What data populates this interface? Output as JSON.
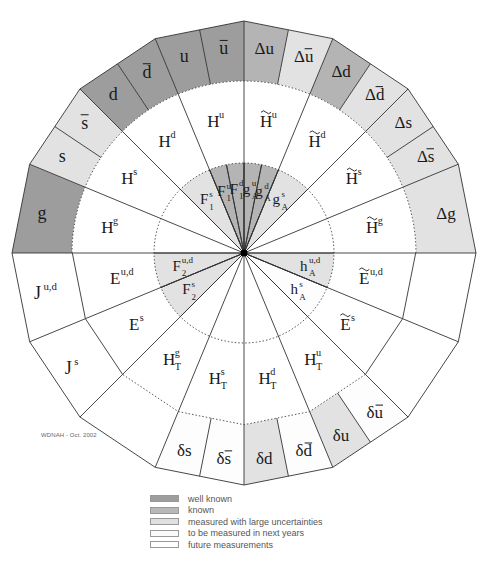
{
  "credit": "WDNAH - Oct. 2002",
  "colors": {
    "well_known": "#9d9d9d",
    "known": "#b8b8b8",
    "large_uncertainties": "#e0e0e0",
    "next_years": "#ffffff",
    "future": "#ffffff",
    "line": "#333333"
  },
  "legend": [
    {
      "label": "well known",
      "color": "#9d9d9d"
    },
    {
      "label": "known",
      "color": "#b8b8b8"
    },
    {
      "label": "measured with large uncertainties",
      "color": "#e0e0e0"
    },
    {
      "label": "to be measured in next years",
      "color": "#fafafa"
    },
    {
      "label": "future measurements",
      "color": "#ffffff"
    }
  ],
  "outer_ring": [
    {
      "id": "g",
      "main": "g",
      "sup": "",
      "sub": "",
      "bar": false,
      "tilde": false,
      "from": -90,
      "to": -67.5,
      "status": "well_known"
    },
    {
      "id": "s",
      "main": "s",
      "sup": "",
      "sub": "",
      "bar": false,
      "tilde": false,
      "from": -67.5,
      "to": -56.25,
      "status": "large_uncertainties"
    },
    {
      "id": "sbar",
      "main": "s",
      "sup": "",
      "sub": "",
      "bar": true,
      "tilde": false,
      "from": -56.25,
      "to": -45,
      "status": "large_uncertainties"
    },
    {
      "id": "d",
      "main": "d",
      "sup": "",
      "sub": "",
      "bar": false,
      "tilde": false,
      "from": -45,
      "to": -33.75,
      "status": "well_known"
    },
    {
      "id": "dbar",
      "main": "d",
      "sup": "",
      "sub": "",
      "bar": true,
      "tilde": false,
      "from": -33.75,
      "to": -22.5,
      "status": "well_known"
    },
    {
      "id": "u",
      "main": "u",
      "sup": "",
      "sub": "",
      "bar": false,
      "tilde": false,
      "from": -22.5,
      "to": -11.25,
      "status": "well_known"
    },
    {
      "id": "ubar",
      "main": "u",
      "sup": "",
      "sub": "",
      "bar": true,
      "tilde": false,
      "from": -11.25,
      "to": 0,
      "status": "well_known"
    },
    {
      "id": "Du",
      "main": "Δu",
      "sup": "",
      "sub": "",
      "bar": false,
      "tilde": false,
      "from": 0,
      "to": 11.25,
      "status": "known"
    },
    {
      "id": "Dubar",
      "main": "Δu",
      "sup": "",
      "sub": "",
      "bar": true,
      "tilde": false,
      "from": 11.25,
      "to": 22.5,
      "status": "large_uncertainties"
    },
    {
      "id": "Dd",
      "main": "Δd",
      "sup": "",
      "sub": "",
      "bar": false,
      "tilde": false,
      "from": 22.5,
      "to": 33.75,
      "status": "known"
    },
    {
      "id": "Ddbar",
      "main": "Δd",
      "sup": "",
      "sub": "",
      "bar": true,
      "tilde": false,
      "from": 33.75,
      "to": 45,
      "status": "large_uncertainties"
    },
    {
      "id": "Ds",
      "main": "Δs",
      "sup": "",
      "sub": "",
      "bar": false,
      "tilde": false,
      "from": 45,
      "to": 56.25,
      "status": "large_uncertainties"
    },
    {
      "id": "Dsbar",
      "main": "Δs",
      "sup": "",
      "sub": "",
      "bar": true,
      "tilde": false,
      "from": 56.25,
      "to": 67.5,
      "status": "large_uncertainties"
    },
    {
      "id": "Dg",
      "main": "Δg",
      "sup": "",
      "sub": "",
      "bar": false,
      "tilde": false,
      "from": 67.5,
      "to": 90,
      "status": "large_uncertainties"
    },
    {
      "id": "blank-r1",
      "main": "",
      "sup": "",
      "sub": "",
      "bar": false,
      "tilde": false,
      "from": 90,
      "to": 112.5,
      "status": "future"
    },
    {
      "id": "blank-r2",
      "main": "",
      "sup": "",
      "sub": "",
      "bar": false,
      "tilde": false,
      "from": 112.5,
      "to": 135,
      "status": "future"
    },
    {
      "id": "dubar",
      "main": "δu",
      "sup": "",
      "sub": "",
      "bar": true,
      "tilde": false,
      "from": 135,
      "to": 146.25,
      "status": "next_years"
    },
    {
      "id": "du",
      "main": "δu",
      "sup": "",
      "sub": "",
      "bar": false,
      "tilde": false,
      "from": 146.25,
      "to": 157.5,
      "status": "large_uncertainties"
    },
    {
      "id": "ddbar",
      "main": "δd",
      "sup": "",
      "sub": "",
      "bar": true,
      "tilde": false,
      "from": 157.5,
      "to": 168.75,
      "status": "next_years"
    },
    {
      "id": "dd",
      "main": "δd",
      "sup": "",
      "sub": "",
      "bar": false,
      "tilde": false,
      "from": 168.75,
      "to": 180,
      "status": "large_uncertainties"
    },
    {
      "id": "dsbar",
      "main": "δs",
      "sup": "",
      "sub": "",
      "bar": true,
      "tilde": false,
      "from": 180,
      "to": 191.25,
      "status": "next_years"
    },
    {
      "id": "ds",
      "main": "δs",
      "sup": "",
      "sub": "",
      "bar": false,
      "tilde": false,
      "from": 191.25,
      "to": 202.5,
      "status": "next_years"
    },
    {
      "id": "blank-l2",
      "main": "",
      "sup": "",
      "sub": "",
      "bar": false,
      "tilde": false,
      "from": 202.5,
      "to": 225,
      "status": "future"
    },
    {
      "id": "Js",
      "main": "J",
      "sup": "s",
      "sub": "",
      "bar": false,
      "tilde": false,
      "from": 225,
      "to": 247.5,
      "status": "future"
    },
    {
      "id": "Jud",
      "main": "J",
      "sup": "u,d",
      "sub": "",
      "bar": false,
      "tilde": false,
      "from": 247.5,
      "to": 270,
      "status": "future"
    }
  ],
  "middle_ring": [
    {
      "id": "Hg",
      "main": "H",
      "sup": "g",
      "sub": "",
      "tilde": false,
      "from": -90,
      "to": -67.5
    },
    {
      "id": "Hs",
      "main": "H",
      "sup": "s",
      "sub": "",
      "tilde": false,
      "from": -67.5,
      "to": -45
    },
    {
      "id": "Hd",
      "main": "H",
      "sup": "d",
      "sub": "",
      "tilde": false,
      "from": -45,
      "to": -22.5
    },
    {
      "id": "Hu",
      "main": "H",
      "sup": "u",
      "sub": "",
      "tilde": false,
      "from": -22.5,
      "to": 0
    },
    {
      "id": "tHu",
      "main": "H",
      "sup": "u",
      "sub": "",
      "tilde": true,
      "from": 0,
      "to": 22.5
    },
    {
      "id": "tHd",
      "main": "H",
      "sup": "d",
      "sub": "",
      "tilde": true,
      "from": 22.5,
      "to": 45
    },
    {
      "id": "tHs",
      "main": "H",
      "sup": "s",
      "sub": "",
      "tilde": true,
      "from": 45,
      "to": 67.5
    },
    {
      "id": "tHg",
      "main": "H",
      "sup": "g",
      "sub": "",
      "tilde": true,
      "from": 67.5,
      "to": 90
    },
    {
      "id": "tEud",
      "main": "E",
      "sup": "u,d",
      "sub": "",
      "tilde": true,
      "from": 90,
      "to": 112.5
    },
    {
      "id": "tEs",
      "main": "E",
      "sup": "s",
      "sub": "",
      "tilde": true,
      "from": 112.5,
      "to": 135
    },
    {
      "id": "HTu",
      "main": "H",
      "sup": "u",
      "sub": "T",
      "tilde": false,
      "from": 135,
      "to": 157.5
    },
    {
      "id": "HTd",
      "main": "H",
      "sup": "d",
      "sub": "T",
      "tilde": false,
      "from": 157.5,
      "to": 180
    },
    {
      "id": "HTs",
      "main": "H",
      "sup": "s",
      "sub": "T",
      "tilde": false,
      "from": 180,
      "to": 202.5
    },
    {
      "id": "HTg",
      "main": "H",
      "sup": "g",
      "sub": "T",
      "tilde": false,
      "from": 202.5,
      "to": 225
    },
    {
      "id": "Es",
      "main": "E",
      "sup": "s",
      "sub": "",
      "tilde": false,
      "from": 225,
      "to": 247.5
    },
    {
      "id": "Eud",
      "main": "E",
      "sup": "u,d",
      "sub": "",
      "tilde": false,
      "from": 247.5,
      "to": 270
    }
  ],
  "inner_ring": [
    {
      "id": "F1s",
      "main": "F",
      "sup": "s",
      "sub": "1",
      "from": -45,
      "to": -22.5,
      "status": "large_uncertainties"
    },
    {
      "id": "F1u",
      "main": "F",
      "sup": "u",
      "sub": "1",
      "from": -22.5,
      "to": -11.25,
      "status": "known"
    },
    {
      "id": "F1d",
      "main": "F",
      "sup": "d",
      "sub": "1",
      "from": -11.25,
      "to": 0,
      "status": "known"
    },
    {
      "id": "gAu",
      "main": "g",
      "sup": "u",
      "sub": "A",
      "from": 0,
      "to": 11.25,
      "status": "known"
    },
    {
      "id": "gAd",
      "main": "g",
      "sup": "d",
      "sub": "A",
      "from": 11.25,
      "to": 22.5,
      "status": "known"
    },
    {
      "id": "gAs",
      "main": "g",
      "sup": "s",
      "sub": "A",
      "from": 22.5,
      "to": 45,
      "status": "large_uncertainties"
    },
    {
      "id": "hAud",
      "main": "h",
      "sup": "u,d",
      "sub": "A",
      "from": 90,
      "to": 112.5,
      "status": "large_uncertainties"
    },
    {
      "id": "hAs",
      "main": "h",
      "sup": "s",
      "sub": "A",
      "from": 112.5,
      "to": 135,
      "status": "next_years"
    },
    {
      "id": "F2s",
      "main": "F",
      "sup": "s",
      "sub": "2",
      "from": 225,
      "to": 247.5,
      "status": "large_uncertainties"
    },
    {
      "id": "F2ud",
      "main": "F",
      "sup": "u,d",
      "sub": "2",
      "from": 247.5,
      "to": 270,
      "status": "large_uncertainties"
    }
  ]
}
